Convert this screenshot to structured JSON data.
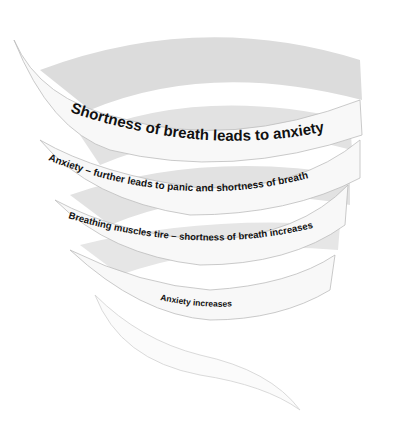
{
  "diagram": {
    "type": "spiral",
    "colors": {
      "ribbon_front": "#f8f8f8",
      "ribbon_back": "#dcdcdc",
      "ribbon_edge": "#bdbdbd",
      "text": "#111111",
      "background": "#ffffff"
    },
    "bands": [
      {
        "label": "Shortness of breath leads to anxiety"
      },
      {
        "label": "Anxiety – further leads to panic and shortness of breath"
      },
      {
        "label": "Breathing muscles tire – shortness of breath increases"
      },
      {
        "label": "Anxiety increases"
      }
    ]
  }
}
